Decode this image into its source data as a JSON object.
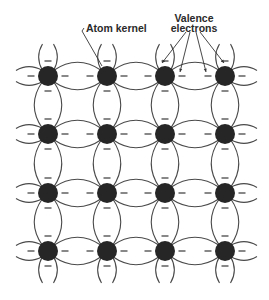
{
  "labels": {
    "atom_kernel": "Atom kernel",
    "valence_line1": "Valence",
    "valence_line2": "electrons"
  },
  "lattice": {
    "columns_x": [
      48,
      107,
      165,
      225
    ],
    "rows_y": [
      76,
      134,
      193,
      251
    ],
    "atom_radius": 10,
    "atom_color": "#262626",
    "line_color": "#4a4a4a",
    "lens_bulge": 11,
    "edge_extent": 32
  },
  "annotations": {
    "kernel_leader": {
      "from": [
        84,
        28
      ],
      "hook": [
        82,
        31
      ],
      "to": [
        102,
        66
      ]
    },
    "valence_arrows": [
      {
        "from": [
          186,
          32
        ],
        "to": [
          162,
          63
        ]
      },
      {
        "from": [
          190,
          32
        ],
        "to": [
          180,
          72
        ]
      },
      {
        "from": [
          196,
          32
        ],
        "to": [
          206,
          72
        ]
      },
      {
        "from": [
          200,
          32
        ],
        "to": [
          224,
          63
        ]
      }
    ]
  }
}
